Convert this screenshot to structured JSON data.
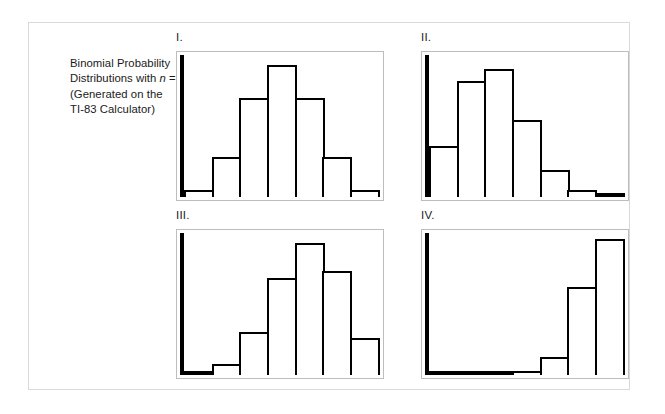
{
  "figure": {
    "caption_line1": "Binomial Probability",
    "caption_line2_pre": "Distributions with ",
    "caption_line2_var": "n",
    "caption_line2_post": " = 6",
    "caption_line3": "(Generated on the",
    "caption_line4": "TI-83 Calculator)",
    "border_color": "#d9d9d9",
    "plot_border_color": "#bdbdbd",
    "bar_color": "#000000",
    "background_color": "#ffffff"
  },
  "panels": [
    {
      "label": "I."
    },
    {
      "label": "II."
    },
    {
      "label": "III."
    },
    {
      "label": "IV."
    }
  ],
  "chart_data": [
    {
      "type": "bar",
      "title": "I.",
      "categories": [
        "0",
        "1",
        "2",
        "3",
        "4",
        "5",
        "6"
      ],
      "values": [
        0.016,
        0.094,
        0.234,
        0.313,
        0.234,
        0.094,
        0.016
      ],
      "bar_heights_pct": [
        5,
        28,
        70,
        93,
        70,
        28,
        5
      ],
      "xlabel": "",
      "ylabel": "",
      "ylim": [
        0,
        0.34
      ],
      "grid": false,
      "legend": "none",
      "annotation": "Symmetric binomial distribution, n = 6, p = 0.5"
    },
    {
      "type": "bar",
      "title": "II.",
      "categories": [
        "0",
        "1",
        "2",
        "3",
        "4",
        "5",
        "6"
      ],
      "values": [
        0.118,
        0.303,
        0.324,
        0.185,
        0.06,
        0.01,
        0.001
      ],
      "bar_heights_pct": [
        36,
        82,
        90,
        54,
        19,
        5,
        1
      ],
      "xlabel": "",
      "ylabel": "",
      "ylim": [
        0,
        0.36
      ],
      "grid": false,
      "legend": "none",
      "annotation": "Right-skewed binomial distribution, n = 6, p = 0.3"
    },
    {
      "type": "bar",
      "title": "III.",
      "categories": [
        "0",
        "1",
        "2",
        "3",
        "4",
        "5",
        "6"
      ],
      "values": [
        0.004,
        0.037,
        0.138,
        0.276,
        0.311,
        0.187,
        0.047
      ],
      "bar_heights_pct": [
        1,
        8,
        30,
        68,
        93,
        73,
        26
      ],
      "xlabel": "",
      "ylabel": "",
      "ylim": [
        0,
        0.34
      ],
      "grid": false,
      "legend": "none",
      "annotation": "Left-skewed binomial distribution, n = 6, p = 0.6"
    },
    {
      "type": "bar",
      "title": "IV.",
      "categories": [
        "0",
        "1",
        "2",
        "3",
        "4",
        "5",
        "6"
      ],
      "values": [
        0.0,
        0.001,
        0.001,
        0.004,
        0.04,
        0.21,
        0.35
      ],
      "bar_heights_pct": [
        0,
        1,
        1,
        3,
        13,
        62,
        96
      ],
      "xlabel": "",
      "ylabel": "",
      "ylim": [
        0,
        0.38
      ],
      "grid": false,
      "legend": "none",
      "annotation": "Strongly left-skewed binomial distribution, n = 6, p = 0.85"
    }
  ]
}
